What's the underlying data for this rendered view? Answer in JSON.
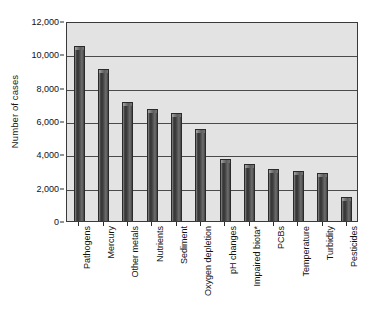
{
  "chart_data": {
    "type": "bar",
    "title": "",
    "xlabel": "",
    "ylabel": "Number of cases",
    "ylim": [
      0,
      12000
    ],
    "grid": true,
    "legend": "none",
    "orientation": "vertical",
    "ytick_labels": [
      "0",
      "2,000",
      "4,000",
      "6,000",
      "8,000",
      "10,000",
      "12,000"
    ],
    "ytick_values": [
      0,
      2000,
      4000,
      6000,
      8000,
      10000,
      12000
    ],
    "categories": [
      "Pathogens",
      "Mercury",
      "Other metals",
      "Nutrients",
      "Sediment",
      "Oxygen depletion",
      "pH changes",
      "Impaired biota*",
      "PCBs",
      "Temperature",
      "Turbidity",
      "Pesticides"
    ],
    "values": [
      10500,
      9100,
      7150,
      6750,
      6500,
      5500,
      3750,
      3450,
      3150,
      3000,
      2900,
      1450
    ],
    "bar_color": "#4a4a4a",
    "plot_background": "#e3e3e3",
    "gridline_color": "#4a4a4a",
    "annotations": [
      "*Impaired biota marked with asterisk footnote"
    ]
  }
}
